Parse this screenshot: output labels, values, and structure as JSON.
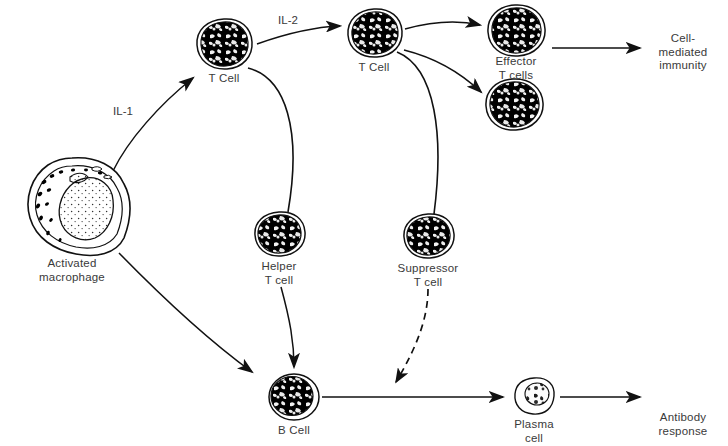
{
  "figure": {
    "type": "biological-flow-diagram",
    "background_color": "#ffffff",
    "ink_color": "#000000",
    "label_color": "#3a3a3a"
  },
  "cells": [
    {
      "id": "activated-macrophage",
      "label": "Activated\nmacrophage",
      "x": 72,
      "y": 205,
      "rx": 52,
      "ry": 47,
      "style": "stippled-outline"
    },
    {
      "id": "t-cell-1",
      "label": "T Cell",
      "x": 224,
      "y": 44,
      "rx": 27,
      "ry": 24,
      "style": "solid-dark"
    },
    {
      "id": "t-cell-2",
      "label": "T Cell",
      "x": 374,
      "y": 33,
      "rx": 26,
      "ry": 23,
      "style": "solid-dark"
    },
    {
      "id": "effector-t-cell-upper",
      "label": "",
      "x": 515,
      "y": 30,
      "rx": 27,
      "ry": 24,
      "style": "solid-dark"
    },
    {
      "id": "effector-t-cell-lower",
      "label": "",
      "x": 513,
      "y": 104,
      "rx": 27,
      "ry": 24,
      "style": "solid-dark"
    },
    {
      "id": "helper-t-cell",
      "label": "Helper\nT cell",
      "x": 279,
      "y": 233,
      "rx": 24,
      "ry": 21,
      "style": "solid-dark"
    },
    {
      "id": "suppressor-t-cell",
      "label": "Suppressor\nT cell",
      "x": 428,
      "y": 235,
      "rx": 24,
      "ry": 21,
      "style": "solid-dark"
    },
    {
      "id": "b-cell",
      "label": "B Cell",
      "x": 294,
      "y": 397,
      "rx": 25,
      "ry": 23,
      "style": "mottled-round"
    },
    {
      "id": "plasma-cell",
      "label": "Plasma\ncell",
      "x": 534,
      "y": 396,
      "rx": 20,
      "ry": 18,
      "style": "light-mottled"
    }
  ],
  "cell_labels": [
    {
      "id": "label-activated-macrophage",
      "text": "Activated\nmacrophage",
      "x": 72,
      "y": 257
    },
    {
      "id": "label-t-cell-1",
      "text": "T Cell",
      "x": 224,
      "y": 72
    },
    {
      "id": "label-t-cell-2",
      "text": "T Cell",
      "x": 374,
      "y": 61
    },
    {
      "id": "label-effector-t-cells",
      "text": "Effector\nT cells",
      "x": 516,
      "y": 55
    },
    {
      "id": "label-helper-t-cell",
      "text": "Helper\nT cell",
      "x": 279,
      "y": 260
    },
    {
      "id": "label-suppressor-t-cell",
      "text": "Suppressor\nT cell",
      "x": 428,
      "y": 262
    },
    {
      "id": "label-b-cell",
      "text": "B Cell",
      "x": 294,
      "y": 424
    },
    {
      "id": "label-plasma-cell",
      "text": "Plasma\ncell",
      "x": 534,
      "y": 418
    },
    {
      "id": "label-cell-mediated-immunity",
      "text": "Cell-\nmediated\nimmunity",
      "x": 683,
      "y": 32
    },
    {
      "id": "label-antibody-response",
      "text": "Antibody\nresponse",
      "x": 683,
      "y": 411
    }
  ],
  "cytokine_labels": [
    {
      "id": "il-1",
      "text": "IL-1",
      "x": 123,
      "y": 105
    },
    {
      "id": "il-2",
      "text": "IL-2",
      "x": 288,
      "y": 14
    }
  ],
  "arrows": [
    {
      "id": "macrophage-to-t-cell-1",
      "style": "solid",
      "from": "activated-macrophage",
      "to": "t-cell-1",
      "cytokine": "IL-1"
    },
    {
      "id": "t-cell-1-to-t-cell-2",
      "style": "solid",
      "from": "t-cell-1",
      "to": "t-cell-2",
      "cytokine": "IL-2"
    },
    {
      "id": "t-cell-2-to-effector-upper",
      "style": "solid",
      "from": "t-cell-2",
      "to": "effector-t-cell-upper"
    },
    {
      "id": "t-cell-2-to-effector-lower",
      "style": "solid",
      "from": "t-cell-2",
      "to": "effector-t-cell-lower"
    },
    {
      "id": "effector-to-cell-mediated-immunity",
      "style": "solid",
      "from": "effector-t-cell-upper",
      "to": "cell-mediated-immunity"
    },
    {
      "id": "t-cell-1-to-helper-t-cell",
      "style": "leader-line",
      "from": "t-cell-1",
      "to": "helper-t-cell"
    },
    {
      "id": "t-cell-2-to-suppressor-t-cell",
      "style": "leader-line",
      "from": "t-cell-2",
      "to": "suppressor-t-cell"
    },
    {
      "id": "macrophage-to-b-cell",
      "style": "solid",
      "from": "activated-macrophage",
      "to": "b-cell"
    },
    {
      "id": "helper-t-cell-to-b-cell",
      "style": "solid",
      "from": "helper-t-cell",
      "to": "b-cell"
    },
    {
      "id": "b-cell-to-plasma-cell",
      "style": "solid",
      "from": "b-cell",
      "to": "plasma-cell"
    },
    {
      "id": "suppressor-inhibition",
      "style": "dashed",
      "from": "suppressor-t-cell",
      "to": "b-cell-to-plasma-cell"
    },
    {
      "id": "plasma-cell-to-antibody-response",
      "style": "solid",
      "from": "plasma-cell",
      "to": "antibody-response"
    }
  ],
  "caption": {
    "text": ""
  }
}
